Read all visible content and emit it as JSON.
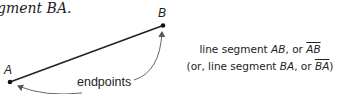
{
  "caption_fragment": "gment BA.",
  "points": {
    "a": {
      "label": "A"
    },
    "b": {
      "label": "B"
    }
  },
  "annotation": {
    "label": "endpoints"
  },
  "description": {
    "line1": {
      "prefix": "line segment ",
      "name": "AB",
      "mid": ", or ",
      "notation": "AB"
    },
    "line2": {
      "prefix": "(or, line segment ",
      "name": "BA",
      "mid": ", or ",
      "notation": "BA",
      "suffix": ")"
    }
  },
  "colors": {
    "ink": "#222222",
    "arrow": "#555555",
    "background": "#ffffff"
  }
}
